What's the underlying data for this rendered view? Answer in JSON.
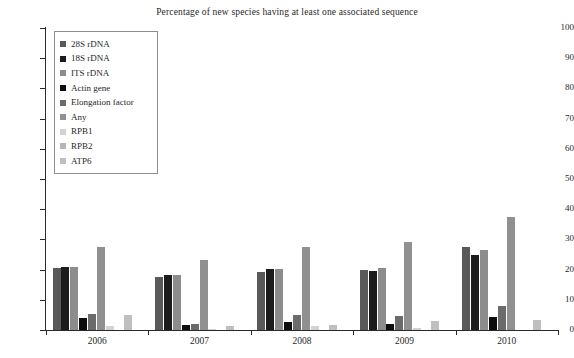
{
  "chart_data": {
    "type": "bar",
    "title": "Percentage of new species having at least one associated sequence",
    "xlabel": "",
    "ylabel": "",
    "ylim": [
      0,
      100
    ],
    "ytick_values": [
      0,
      10,
      20,
      30,
      40,
      50,
      60,
      70,
      80,
      90,
      100
    ],
    "ytick_labels": [
      "0",
      "10",
      "20",
      "30",
      "40",
      "50",
      "60",
      "70",
      "80",
      "90",
      "100"
    ],
    "grid": false,
    "legend_position": "upper-left-inside",
    "categories": [
      "2006",
      "2007",
      "2008",
      "2009",
      "2010"
    ],
    "series": [
      {
        "name": "28S rDNA",
        "color": "#595959",
        "values": [
          20.5,
          17.5,
          19.3,
          20.0,
          27.5
        ]
      },
      {
        "name": "18S rDNA",
        "color": "#1c1c1c",
        "values": [
          21.0,
          18.2,
          20.3,
          19.5,
          25.0
        ]
      },
      {
        "name": "ITS rDNA",
        "color": "#8c8c8c",
        "values": [
          21.0,
          18.3,
          20.2,
          20.4,
          26.5
        ]
      },
      {
        "name": "Actin gene",
        "color": "#0d0d0d",
        "values": [
          4.0,
          1.7,
          2.6,
          2.1,
          4.3
        ]
      },
      {
        "name": "Elongation factor",
        "color": "#6b6b6b",
        "values": [
          5.2,
          2.0,
          5.1,
          4.5,
          8.0
        ]
      },
      {
        "name": "Any",
        "color": "#909090",
        "values": [
          27.5,
          23.2,
          27.6,
          29.0,
          37.3
        ]
      },
      {
        "name": "RPB1",
        "color": "#d2d2d2",
        "values": [
          1.3,
          0.5,
          1.2,
          0.6,
          0.0
        ]
      },
      {
        "name": "RPB2",
        "color": "#b5b5b5",
        "values": [
          0.0,
          0.0,
          0.0,
          0.0,
          0.0
        ]
      },
      {
        "name": "ATP6",
        "color": "#bfbfbf",
        "values": [
          5.0,
          1.3,
          1.8,
          3.0,
          3.3
        ]
      }
    ]
  }
}
